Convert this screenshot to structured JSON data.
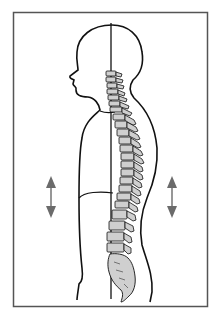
{
  "figure": {
    "colors": {
      "background": "#ffffff",
      "frame": "#555555",
      "outline": "#111111",
      "vertebra_fill": "#cfcfcf",
      "arrow": "#6b6b6b"
    },
    "elements": {
      "frame": "frame-border",
      "body": "body-silhouette",
      "plumb_line": "vertical-reference-line",
      "spine": "vertebral-column",
      "sacrum": "sacrum-coccyx",
      "arrows": [
        "left-double-arrow",
        "right-double-arrow"
      ]
    }
  }
}
